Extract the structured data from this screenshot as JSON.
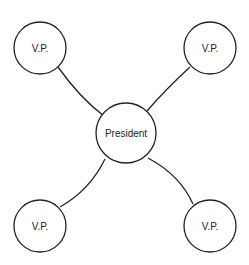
{
  "diagram": {
    "center": {
      "label": "President"
    },
    "nodes": [
      {
        "label": "V.P.",
        "position": "top-left"
      },
      {
        "label": "V.P.",
        "position": "top-right"
      },
      {
        "label": "V.P.",
        "position": "bottom-left"
      },
      {
        "label": "V.P.",
        "position": "bottom-right"
      }
    ],
    "colors": {
      "stroke": "#222222",
      "fill": "#ffffff"
    }
  }
}
